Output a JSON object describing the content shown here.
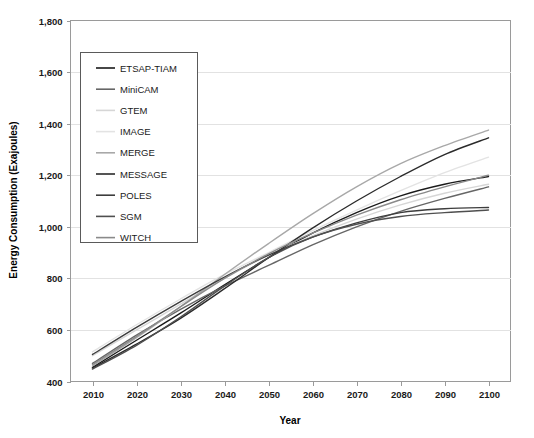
{
  "chart_data": {
    "type": "line",
    "title": "",
    "xlabel": "Year",
    "ylabel": "Energy Consumption (Exajoules)",
    "x": [
      2010,
      2020,
      2030,
      2040,
      2050,
      2060,
      2070,
      2080,
      2090,
      2100
    ],
    "xtick_labels": [
      "2010",
      "2020",
      "2030",
      "2040",
      "2050",
      "2060",
      "2070",
      "2080",
      "2090",
      "2100"
    ],
    "ytick_labels": [
      "400",
      "600",
      "800",
      "1,000",
      "1,200",
      "1,400",
      "1,600",
      "1,800"
    ],
    "yticks": [
      400,
      600,
      800,
      1000,
      1200,
      1400,
      1600,
      1800
    ],
    "xlim": [
      2005,
      2105
    ],
    "ylim": [
      400,
      1800
    ],
    "grid": true,
    "legend_position": "upper-left-inside",
    "series": [
      {
        "name": "ETSAP-TIAM",
        "color": "#1a1a1a",
        "values": [
          455,
          560,
          665,
          775,
          880,
          975,
          1055,
          1120,
          1165,
          1195
        ]
      },
      {
        "name": "MiniCAM",
        "color": "#666666",
        "values": [
          470,
          580,
          680,
          770,
          850,
          930,
          1000,
          1060,
          1110,
          1155
        ]
      },
      {
        "name": "GTEM",
        "color": "#d6d6d6",
        "values": [
          500,
          600,
          700,
          800,
          890,
          965,
          1030,
          1085,
          1130,
          1165
        ]
      },
      {
        "name": "IMAGE",
        "color": "#e3e3e3",
        "values": [
          515,
          620,
          720,
          815,
          900,
          985,
          1065,
          1140,
          1210,
          1270
        ]
      },
      {
        "name": "MERGE",
        "color": "#a8a8a8",
        "values": [
          460,
          570,
          690,
          815,
          935,
          1050,
          1155,
          1245,
          1315,
          1375
        ]
      },
      {
        "name": "MESSAGE",
        "color": "#2b2b2b",
        "values": [
          452,
          545,
          645,
          760,
          880,
          995,
          1100,
          1195,
          1280,
          1345
        ]
      },
      {
        "name": "POLES",
        "color": "#3d3d3d",
        "values": [
          505,
          610,
          710,
          805,
          890,
          960,
          1015,
          1055,
          1070,
          1075
        ]
      },
      {
        "name": "SGM",
        "color": "#4f4f4f",
        "values": [
          448,
          540,
          650,
          770,
          880,
          960,
          1010,
          1040,
          1055,
          1065
        ]
      },
      {
        "name": "WITCH",
        "color": "#8a8a8a",
        "values": [
          465,
          575,
          690,
          800,
          895,
          975,
          1045,
          1105,
          1155,
          1200
        ]
      }
    ]
  },
  "legend": {
    "items": [
      {
        "label": "ETSAP-TIAM",
        "color": "#1a1a1a"
      },
      {
        "label": "MiniCAM",
        "color": "#666666"
      },
      {
        "label": "GTEM",
        "color": "#d6d6d6"
      },
      {
        "label": "IMAGE",
        "color": "#e3e3e3"
      },
      {
        "label": "MERGE",
        "color": "#a8a8a8"
      },
      {
        "label": "MESSAGE",
        "color": "#2b2b2b"
      },
      {
        "label": "POLES",
        "color": "#3d3d3d"
      },
      {
        "label": "SGM",
        "color": "#4f4f4f"
      },
      {
        "label": "WITCH",
        "color": "#8a8a8a"
      }
    ]
  }
}
